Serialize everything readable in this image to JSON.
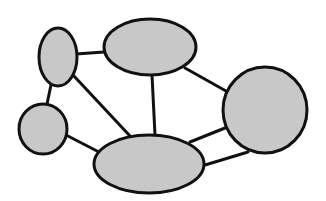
{
  "diagram": {
    "type": "undirected-graph",
    "width": 326,
    "height": 201,
    "style": {
      "node_fill": "#c8c8c8",
      "stroke": "#111111",
      "node_stroke_width": 3,
      "edge_stroke_width": 3,
      "background": "#ffffff"
    },
    "nodes": [
      {
        "id": "A",
        "shape": "ellipse",
        "cx": 58,
        "cy": 57,
        "rx": 19,
        "ry": 29
      },
      {
        "id": "B",
        "shape": "ellipse",
        "cx": 150,
        "cy": 47,
        "rx": 46,
        "ry": 28
      },
      {
        "id": "C",
        "shape": "ellipse",
        "cx": 265,
        "cy": 110,
        "rx": 42,
        "ry": 43
      },
      {
        "id": "D",
        "shape": "ellipse",
        "cx": 149,
        "cy": 164,
        "rx": 55,
        "ry": 29
      },
      {
        "id": "E",
        "shape": "ellipse",
        "cx": 43,
        "cy": 129,
        "rx": 24,
        "ry": 25
      }
    ],
    "edges": [
      {
        "from": "A",
        "to": "B",
        "x1": 76,
        "y1": 54,
        "x2": 104,
        "y2": 52
      },
      {
        "from": "A",
        "to": "E",
        "x1": 51,
        "y1": 85,
        "x2": 47,
        "y2": 104
      },
      {
        "from": "A",
        "to": "D",
        "x1": 73,
        "y1": 75,
        "x2": 130,
        "y2": 136
      },
      {
        "from": "B",
        "to": "D",
        "x1": 152,
        "y1": 75,
        "x2": 155,
        "y2": 135
      },
      {
        "from": "B",
        "to": "C",
        "x1": 185,
        "y1": 68,
        "x2": 226,
        "y2": 91
      },
      {
        "from": "C",
        "to": "D",
        "x1": 190,
        "y1": 142,
        "x2": 225,
        "y2": 128
      },
      {
        "from": "C",
        "to": "D",
        "x1": 205,
        "y1": 165,
        "x2": 248,
        "y2": 152
      },
      {
        "from": "E",
        "to": "D",
        "x1": 66,
        "y1": 135,
        "x2": 97,
        "y2": 151
      }
    ]
  }
}
